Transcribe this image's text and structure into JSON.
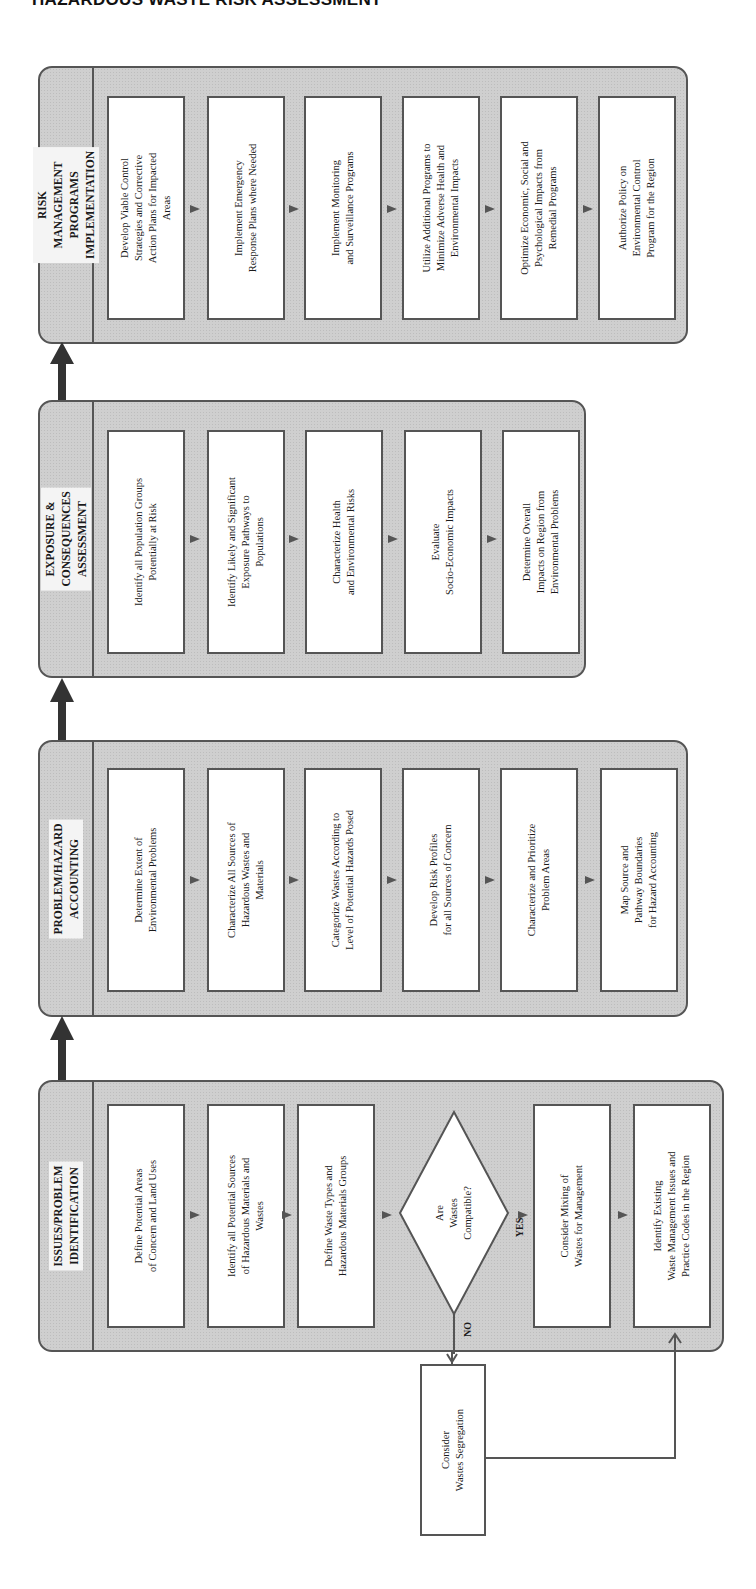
{
  "page_title": "HAZARDOUS WASTE RISK ASSESSMENT",
  "stages": [
    {
      "title": "RISK MANAGEMENT\nPROGRAMS IMPLEMENTATION",
      "steps": [
        "Develop Viable Control\nStrategies and Corrective\nAction Plans for Impacted\nAreas",
        "Implement Emergency\nResponse Plans where Needed",
        "Implement Monitoring\nand Surveillance Programs",
        "Utilize Additional Programs to\nMinimize Adverse Health and\nEnvironmental Impacts",
        "Optimize Economic, Social and\nPsychological Impacts from\nRemedial Programs",
        "Authorize Policy on\nEnvironmental Control\nProgram for the Region"
      ]
    },
    {
      "title": "EXPOSURE & CONSEQUENCES\nASSESSMENT",
      "steps": [
        "Identify all Population Groups\nPotentially at Risk",
        "Identify Likely and Significant\nExposure Pathways to\nPopulations",
        "Characterize Health\nand Environmental Risks",
        "Evaluate\nSocio-Economic Impacts",
        "Determine Overall\nImpacts on Region from\nEnvironmental Problems"
      ]
    },
    {
      "title": "PROBLEM/HAZARD\nACCOUNTING",
      "steps": [
        "Determine Extent of\nEnvironmental Problems",
        "Characterize All Sources of\nHazardous Wastes and\nMaterials",
        "Categorize Wastes According to\nLevel of Potential Hazards Posed",
        "Develop Risk Profiles\nfor all Sources of Concern",
        "Characterize and Prioritize\nProblem Areas",
        "Map Source and\nPathway Boundaries\nfor Hazard Accounting"
      ]
    },
    {
      "title": "ISSUES/PROBLEM\nIDENTIFICATION",
      "steps": [
        "Define Potential Areas\nof Concern and Land Uses",
        "Identify all Potential Sources\nof Hazardous Materials and\nWastes",
        "Define Waste Types and\nHazardous Materials Groups",
        "Consider Mixing of\nWastes for Management",
        "Identify Existing\nWaste Management Issues and\nPractice Codes in the Region"
      ],
      "decision": "Are\nWastes\nCompatible?",
      "yes_label": "YES",
      "no_label": "NO",
      "side_step": "Consider\nWastes Segregation"
    }
  ],
  "colors": {
    "band_fill": "#cfcfcf",
    "stroke": "#555555",
    "box_fill": "#ffffff"
  }
}
